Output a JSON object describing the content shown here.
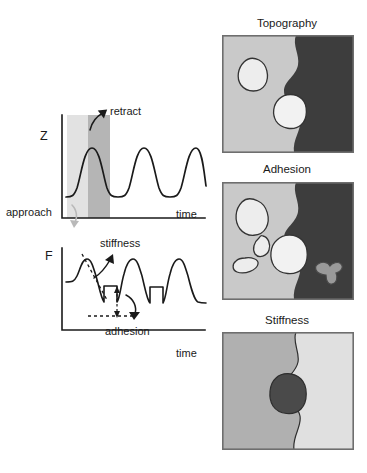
{
  "figure": {
    "background": "#ffffff"
  },
  "plots": {
    "z_plot": {
      "y_axis_label": "Z",
      "x_axis_label": "time",
      "annotations": {
        "retract": "retract",
        "approach": "approach"
      },
      "bands": [
        {
          "name": "approach-band",
          "color": "#e2e2e2",
          "x_start": 67,
          "x_end": 88
        },
        {
          "name": "retract-band",
          "color": "#b5b5b5",
          "x_start": 88,
          "x_end": 110
        }
      ],
      "curve": {
        "shape": "sinusoid",
        "cycles": 3,
        "baseline_y": 196,
        "peak_y": 147
      }
    },
    "f_plot": {
      "y_axis_label": "F",
      "x_axis_label": "time",
      "annotations": {
        "stiffness": "stiffness",
        "adhesion": "adhesion"
      },
      "curve": {
        "shape": "force-vs-time peaks with adhesion pull-off steps",
        "cycles": 3
      }
    }
  },
  "maps": [
    {
      "title": "Topography",
      "left_region_color": "#c9c9c9",
      "right_region_color": "#3d3d3d",
      "features": [
        {
          "name": "blob-upper-left",
          "fill": "#ededed",
          "stroke": "#333333"
        },
        {
          "name": "blob-center",
          "fill": "#f2f2f2",
          "stroke": "#333333"
        }
      ]
    },
    {
      "title": "Adhesion",
      "left_region_color": "#c9c9c9",
      "right_region_color": "#3d3d3d",
      "features": [
        {
          "name": "blob-upper-left",
          "fill": "#ededed",
          "stroke": "#333333"
        },
        {
          "name": "blob-small-mid",
          "fill": "#ededed",
          "stroke": "#333333"
        },
        {
          "name": "blob-small-lower",
          "fill": "#ededed",
          "stroke": "#333333"
        },
        {
          "name": "blob-center",
          "fill": "#f2f2f2",
          "stroke": "#333333"
        },
        {
          "name": "tripod-feature",
          "fill": "#9a9a9a",
          "stroke": "#4a4a4a"
        }
      ]
    },
    {
      "title": "Stiffness",
      "left_region_color": "#b0b0b0",
      "right_region_color": "#e0e0e0",
      "features": [
        {
          "name": "blob-center-dark",
          "fill": "#4a4a4a",
          "stroke": "#2e2e2e"
        }
      ]
    }
  ],
  "colors": {
    "ink": "#1a1a1a",
    "panel_border": "#6e6e6e",
    "approach_arrow": "#b9b9b9"
  }
}
